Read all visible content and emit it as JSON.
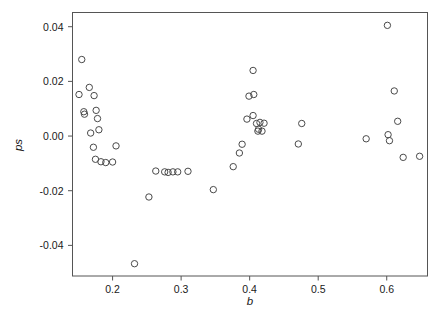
{
  "chart_data": {
    "type": "scatter",
    "title": "",
    "xlabel": "b",
    "ylabel": "ps",
    "xlim": [
      0.1415,
      0.6595
    ],
    "ylim": [
      -0.0512,
      0.0452
    ],
    "xticks": [
      0.2,
      0.3,
      0.4,
      0.5,
      0.6
    ],
    "xticklabels": [
      "0.2",
      "0.3",
      "0.4",
      "0.5",
      "0.6"
    ],
    "yticks": [
      0.04,
      0.02,
      0.0,
      -0.02,
      -0.04
    ],
    "yticklabels": [
      "0.04",
      "0.02",
      "0.00",
      "-0.02",
      "-0.04"
    ],
    "grid": false,
    "legend": null,
    "marker": "open-circle",
    "marker_color": "#4a4a4a",
    "marker_radius_px": 3.2,
    "n_points": 49,
    "x": [
      0.155,
      0.151,
      0.166,
      0.173,
      0.158,
      0.159,
      0.176,
      0.178,
      0.18,
      0.168,
      0.172,
      0.175,
      0.183,
      0.19,
      0.2,
      0.205,
      0.232,
      0.253,
      0.263,
      0.276,
      0.281,
      0.288,
      0.295,
      0.31,
      0.347,
      0.376,
      0.385,
      0.389,
      0.396,
      0.399,
      0.406,
      0.405,
      0.405,
      0.41,
      0.412,
      0.413,
      0.415,
      0.418,
      0.421,
      0.471,
      0.476,
      0.57,
      0.601,
      0.602,
      0.604,
      0.611,
      0.616,
      0.624,
      0.648
    ],
    "y": [
      0.028,
      0.0152,
      0.0178,
      0.0148,
      0.0089,
      0.008,
      0.0094,
      0.0064,
      0.0023,
      0.0011,
      -0.0041,
      -0.0085,
      -0.0094,
      -0.0097,
      -0.0095,
      -0.0036,
      -0.0467,
      -0.0223,
      -0.0128,
      -0.0131,
      -0.0133,
      -0.0131,
      -0.0131,
      -0.0129,
      -0.0196,
      -0.0112,
      -0.0062,
      -0.003,
      0.0062,
      0.0146,
      0.0152,
      0.024,
      0.0075,
      0.0046,
      0.0018,
      0.0025,
      0.005,
      0.0018,
      0.0047,
      -0.0029,
      0.0046,
      -0.001,
      0.0405,
      0.0005,
      -0.0017,
      0.0165,
      0.0054,
      -0.0078,
      -0.0074
    ]
  },
  "axes": {
    "y_label": "ps",
    "x_label": "b"
  }
}
